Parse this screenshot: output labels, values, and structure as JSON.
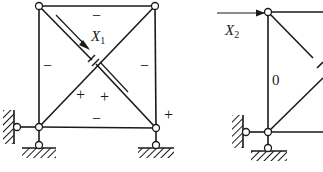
{
  "figure": {
    "colors": {
      "line": "#1a1a1a",
      "node_fill": "#ffffff",
      "background": "#ffffff"
    }
  },
  "left_truss": {
    "redundant_label": "X",
    "redundant_index": "1",
    "member_signs": {
      "top_chord": "−",
      "left_vertical": "−",
      "right_vertical": "−",
      "bottom_chord": "−",
      "diagonal_1": "+",
      "diagonal_2": "+",
      "support_reaction": "+"
    }
  },
  "right_truss": {
    "redundant_label": "X",
    "redundant_index": "2",
    "member_values": {
      "left_vertical": "0"
    }
  }
}
